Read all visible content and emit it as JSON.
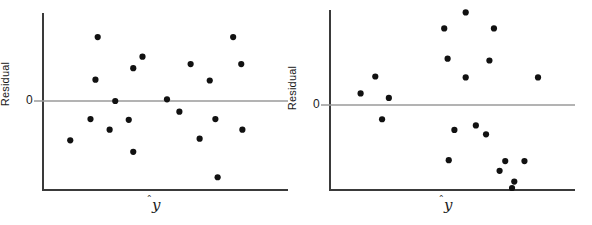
{
  "figure": {
    "background": "#ffffff",
    "point_color": "#111111",
    "axis_color": "#3a3a3a",
    "zero_line_color": "#9a9a9a",
    "panel_count": 2
  },
  "chart_data": [
    {
      "type": "scatter",
      "panel": "left",
      "title": "",
      "xlabel": "ŷ",
      "ylabel": "Residual",
      "ytick_labels": [
        "0"
      ],
      "ytick_values": [
        0
      ],
      "grid": false,
      "legend": null,
      "xlim": [
        0,
        100
      ],
      "ylim": [
        -100,
        100
      ],
      "note": "Residual plot showing no pattern (random scatter about zero)",
      "points": [
        {
          "x": 21.2,
          "y": 78.0
        },
        {
          "x": 41.1,
          "y": 54.0
        },
        {
          "x": 81.4,
          "y": 78.0
        },
        {
          "x": 20.2,
          "y": 26.0
        },
        {
          "x": 37.0,
          "y": 40.0
        },
        {
          "x": 62.5,
          "y": 45.0
        },
        {
          "x": 85.0,
          "y": 45.0
        },
        {
          "x": 71.0,
          "y": 25.0
        },
        {
          "x": 29.0,
          "y": 0.0
        },
        {
          "x": 52.0,
          "y": 2.0
        },
        {
          "x": 18.0,
          "y": -22.0
        },
        {
          "x": 35.0,
          "y": -23.0
        },
        {
          "x": 57.5,
          "y": -13.0
        },
        {
          "x": 73.5,
          "y": -22.0
        },
        {
          "x": 26.5,
          "y": -35.0
        },
        {
          "x": 9.0,
          "y": -48.0
        },
        {
          "x": 66.5,
          "y": -46.0
        },
        {
          "x": 85.5,
          "y": -35.0
        },
        {
          "x": 37.0,
          "y": -62.0
        },
        {
          "x": 74.5,
          "y": -93.0
        }
      ]
    },
    {
      "type": "scatter",
      "panel": "right",
      "title": "",
      "xlabel": "ŷ",
      "ylabel": "Residual",
      "ytick_labels": [
        "0"
      ],
      "ytick_values": [
        0
      ],
      "grid": false,
      "legend": null,
      "xlim": [
        0,
        100
      ],
      "ylim": [
        -100,
        100
      ],
      "note": "Residual plot showing a curved (nonlinear) pattern",
      "points": [
        {
          "x": 56.5,
          "y": 104.0
        },
        {
          "x": 47.0,
          "y": 86.0
        },
        {
          "x": 69.0,
          "y": 86.0
        },
        {
          "x": 48.5,
          "y": 52.0
        },
        {
          "x": 67.0,
          "y": 50.0
        },
        {
          "x": 56.5,
          "y": 31.0
        },
        {
          "x": 88.5,
          "y": 31.0
        },
        {
          "x": 16.5,
          "y": 32.0
        },
        {
          "x": 10.0,
          "y": 13.0
        },
        {
          "x": 22.5,
          "y": 8.0
        },
        {
          "x": 19.5,
          "y": -16.0
        },
        {
          "x": 51.5,
          "y": -28.0
        },
        {
          "x": 61.0,
          "y": -23.0
        },
        {
          "x": 65.5,
          "y": -33.0
        },
        {
          "x": 49.0,
          "y": -62.0
        },
        {
          "x": 74.0,
          "y": -63.0
        },
        {
          "x": 82.5,
          "y": -63.0
        },
        {
          "x": 71.5,
          "y": -74.0
        },
        {
          "x": 78.0,
          "y": -86.0
        },
        {
          "x": 77.0,
          "y": -100.0
        }
      ]
    }
  ],
  "panels": [
    {
      "id": "left",
      "ylabel": "Residual",
      "zero_label": "0",
      "xlabel_base": "y",
      "xlabel_hat": "̂"
    },
    {
      "id": "right",
      "ylabel": "Residual",
      "zero_label": "0",
      "xlabel_base": "y",
      "xlabel_hat": "̂"
    }
  ]
}
